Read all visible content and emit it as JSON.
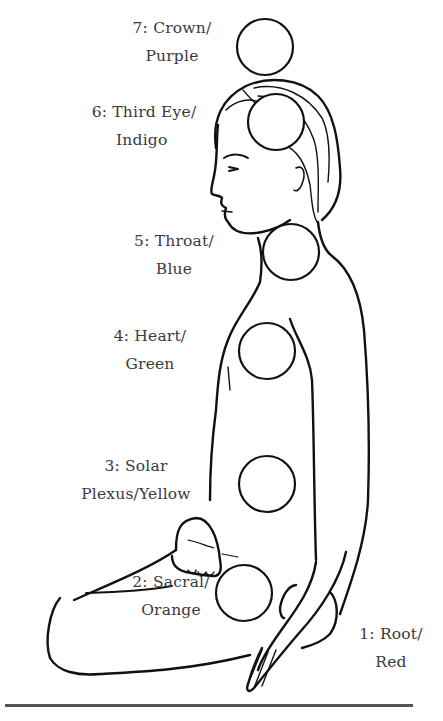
{
  "chakras": [
    {
      "number": 1,
      "name": "Root",
      "color": "Red",
      "line1": "1: Root/",
      "line2": "Red",
      "color_hex": "#d32f2f"
    },
    {
      "number": 2,
      "name": "Sacral",
      "color": "Orange",
      "line1": "2: Sacral/",
      "line2": "Orange",
      "color_hex": "#f57c00"
    },
    {
      "number": 3,
      "name": "Solar Plexus",
      "color": "Yellow",
      "line1": "3: Solar",
      "line2": "Plexus/Yellow",
      "color_hex": "#fbc02d"
    },
    {
      "number": 4,
      "name": "Heart",
      "color": "Green",
      "line1": "4: Heart/",
      "line2": "Green",
      "color_hex": "#388e3c"
    },
    {
      "number": 5,
      "name": "Throat",
      "color": "Blue",
      "line1": "5: Throat/",
      "line2": "Blue",
      "color_hex": "#1976d2"
    },
    {
      "number": 6,
      "name": "Third Eye",
      "color": "Indigo",
      "line1": "6: Third Eye/",
      "line2": "Indigo",
      "color_hex": "#3f51b5"
    },
    {
      "number": 7,
      "name": "Crown",
      "color": "Purple",
      "line1": "7: Crown/",
      "line2": "Purple",
      "color_hex": "#7b1fa2"
    }
  ],
  "style": {
    "line_color": "#111111",
    "text_color": "#3a3a3a",
    "background": "#ffffff"
  }
}
